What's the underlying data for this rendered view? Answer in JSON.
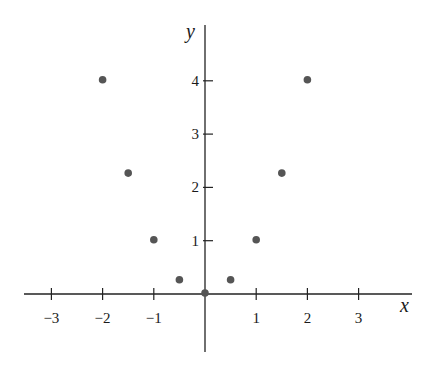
{
  "chart_data": {
    "type": "scatter",
    "title": "",
    "xlabel": "x",
    "ylabel": "y",
    "xlim": [
      -3.5,
      4
    ],
    "ylim": [
      -1.1,
      5.1
    ],
    "grid": false,
    "legend": null,
    "x_ticks": [
      -3,
      -2,
      -1,
      1,
      2,
      3
    ],
    "x_tick_labels": [
      "−3",
      "−2",
      "−1",
      "1",
      "2",
      "3"
    ],
    "y_ticks": [
      1,
      2,
      3,
      4
    ],
    "y_tick_labels": [
      "1",
      "2",
      "3",
      "4"
    ],
    "series": [
      {
        "name": "points",
        "color": "#555555",
        "x": [
          -2,
          -1.5,
          -1,
          -0.5,
          0,
          0.5,
          1,
          1.5,
          2
        ],
        "y": [
          4,
          2.25,
          1,
          0.25,
          0,
          0.25,
          1,
          2.25,
          4
        ]
      }
    ]
  },
  "layout": {
    "origin_px": [
      205,
      294
    ],
    "unit_x_px": 51.2,
    "unit_y_px": 53.3,
    "x_axis_px": [
      24,
      412
    ],
    "y_axis_px": [
      25,
      352
    ],
    "colors": {
      "axis": "#222222",
      "point": "#555555",
      "background": "#ffffff"
    }
  }
}
